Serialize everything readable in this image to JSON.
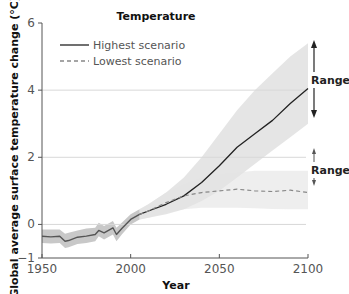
{
  "chart_data": {
    "type": "line",
    "title": "Temperature",
    "xlabel": "Year",
    "ylabel": "Global average surface temperature change (°C)",
    "xlim": [
      1950,
      2100
    ],
    "ylim": [
      -1,
      6
    ],
    "xticks": [
      1950,
      2000,
      2050,
      2100
    ],
    "yticks": [
      -1,
      0,
      2,
      4,
      6
    ],
    "grid": "horizontal at 0, 2, 4",
    "legend": {
      "position": "upper-left",
      "entries": [
        "Highest scenario",
        "Lowest scenario"
      ]
    },
    "annotations": [
      "Range",
      "Range"
    ],
    "series": [
      {
        "name": "Historical",
        "style": "solid dark gray with gray uncertainty band",
        "x": [
          1950,
          1955,
          1960,
          1963,
          1965,
          1970,
          1975,
          1980,
          1982,
          1985,
          1990,
          1992,
          1995,
          2000,
          2005
        ],
        "values": [
          -0.35,
          -0.37,
          -0.35,
          -0.5,
          -0.48,
          -0.38,
          -0.35,
          -0.3,
          -0.18,
          -0.25,
          -0.1,
          -0.3,
          -0.12,
          0.15,
          0.3
        ],
        "band_upper": [
          -0.15,
          -0.15,
          -0.15,
          -0.28,
          -0.25,
          -0.18,
          -0.12,
          -0.1,
          0.05,
          -0.05,
          0.1,
          -0.1,
          0.05,
          0.3,
          0.45
        ],
        "band_lower": [
          -0.55,
          -0.57,
          -0.55,
          -0.7,
          -0.68,
          -0.58,
          -0.55,
          -0.5,
          -0.35,
          -0.45,
          -0.3,
          -0.5,
          -0.3,
          0.0,
          0.15
        ]
      },
      {
        "name": "Highest scenario",
        "style": "solid black",
        "x": [
          2005,
          2010,
          2020,
          2030,
          2040,
          2050,
          2060,
          2070,
          2080,
          2090,
          2100
        ],
        "values": [
          0.3,
          0.4,
          0.6,
          0.85,
          1.25,
          1.75,
          2.3,
          2.7,
          3.1,
          3.6,
          4.05
        ],
        "band_upper": [
          0.45,
          0.6,
          0.95,
          1.4,
          2.0,
          2.7,
          3.4,
          4.0,
          4.5,
          5.0,
          5.4
        ],
        "band_lower": [
          0.15,
          0.2,
          0.3,
          0.45,
          0.7,
          1.0,
          1.4,
          1.8,
          2.2,
          2.6,
          3.0
        ]
      },
      {
        "name": "Lowest scenario",
        "style": "dashed gray",
        "x": [
          2005,
          2010,
          2020,
          2030,
          2040,
          2050,
          2060,
          2070,
          2080,
          2090,
          2100
        ],
        "values": [
          0.3,
          0.4,
          0.65,
          0.85,
          0.95,
          1.0,
          1.05,
          1.0,
          0.98,
          1.02,
          0.95
        ],
        "band_upper": [
          0.45,
          0.6,
          0.95,
          1.2,
          1.4,
          1.5,
          1.55,
          1.6,
          1.6,
          1.6,
          1.6
        ],
        "band_lower": [
          0.15,
          0.2,
          0.35,
          0.45,
          0.5,
          0.5,
          0.5,
          0.48,
          0.46,
          0.45,
          0.45
        ]
      }
    ]
  },
  "labels": {
    "title": "Temperature",
    "xlabel": "Year",
    "ylabel": "Global average surface temperature change (°C)",
    "legend_high": "Highest scenario",
    "legend_low": "Lowest scenario",
    "range_high": "Range",
    "range_low": "Range",
    "xticks": [
      "1950",
      "2000",
      "2050",
      "2100"
    ],
    "yticks": [
      "−1",
      "0",
      "2",
      "4",
      "6"
    ]
  },
  "colors": {
    "band_hist": "#c8c8c8",
    "band_high": "#e2e2e2",
    "band_low": "#ececec",
    "line_hist": "#555555",
    "line_high": "#222222",
    "line_low": "#888888",
    "grid": "#d8d8d8",
    "axis": "#555555"
  }
}
